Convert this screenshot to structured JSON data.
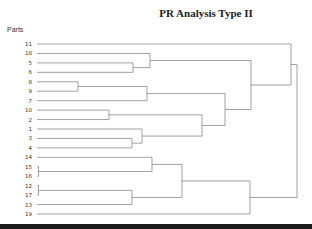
{
  "chart_data": {
    "type": "dendrogram",
    "title": "PR Analysis Type II",
    "ylabel": "Parts",
    "xlabel": "",
    "orientation": "horizontal",
    "leaves": [
      "11",
      "18",
      "5",
      "6",
      "8",
      "9",
      "7",
      "10",
      "2",
      "1",
      "3",
      "4",
      "14",
      "15",
      "16",
      "12",
      "17",
      "13",
      "19"
    ],
    "merges": [
      {
        "a": "15",
        "b": "16",
        "height": 0.3
      },
      {
        "a": "12",
        "b": "17",
        "height": 0.3
      },
      {
        "a": "8",
        "b": "9",
        "height": 16
      },
      {
        "a": "10",
        "b": "2",
        "height": 28
      },
      {
        "a": "3",
        "b": "4",
        "height": 37
      },
      {
        "a": "5",
        "b": "6",
        "height": 37
      },
      {
        "a": "1",
        "b": "(3,4)",
        "height": 40
      },
      {
        "a": "(8,9)",
        "b": "7",
        "height": 42
      },
      {
        "a": "18",
        "b": "(5,6)",
        "height": 44
      },
      {
        "a": "14",
        "b": "(15,16)",
        "height": 45
      },
      {
        "a": "(12,17)",
        "b": "13",
        "height": 56
      },
      {
        "a": "(10,2)",
        "b": "(1,3,4)",
        "height": 64
      },
      {
        "a": "(14,15,16)",
        "b": "(12,17,13)",
        "height": 57
      },
      {
        "a": "(8,9,7)",
        "b": "(10,2,1,3,4)",
        "height": 73
      },
      {
        "a": "(14..13)",
        "b": "19",
        "height": 84
      },
      {
        "a": "(18,5,6)",
        "b": "(8..4)",
        "height": 84
      },
      {
        "a": "11",
        "b": "(18..4)",
        "height": 98
      },
      {
        "a": "(11..4)",
        "b": "(14..19)",
        "height": 100
      }
    ]
  }
}
